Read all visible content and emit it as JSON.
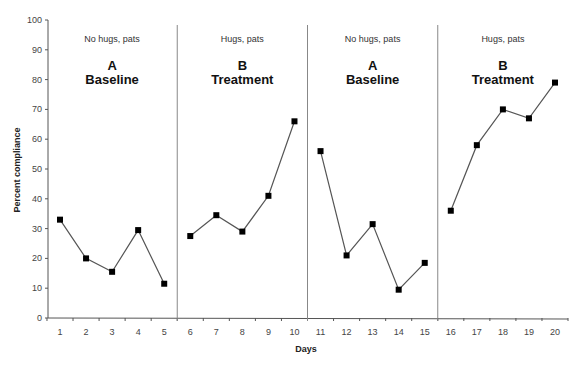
{
  "chart_data": {
    "type": "line",
    "title": "",
    "xlabel": "Days",
    "ylabel": "Percent compliance",
    "ylim": [
      0,
      100
    ],
    "yticks": [
      0,
      10,
      20,
      30,
      40,
      50,
      60,
      70,
      80,
      90,
      100
    ],
    "x": [
      1,
      2,
      3,
      4,
      5,
      6,
      7,
      8,
      9,
      10,
      11,
      12,
      13,
      14,
      15,
      16,
      17,
      18,
      19,
      20
    ],
    "grid": false,
    "legend": null,
    "phases": [
      {
        "letter": "A",
        "name": "Baseline",
        "condition": "No hugs, pats",
        "days": [
          1,
          2,
          3,
          4,
          5
        ],
        "values": [
          33,
          20,
          15.5,
          29.5,
          11.5
        ]
      },
      {
        "letter": "B",
        "name": "Treatment",
        "condition": "Hugs, pats",
        "days": [
          6,
          7,
          8,
          9,
          10
        ],
        "values": [
          27.5,
          34.5,
          29,
          41,
          66
        ]
      },
      {
        "letter": "A",
        "name": "Baseline",
        "condition": "No hugs, pats",
        "days": [
          11,
          12,
          13,
          14,
          15
        ],
        "values": [
          56,
          21,
          31.5,
          9.5,
          18.5
        ]
      },
      {
        "letter": "B",
        "name": "Treatment",
        "condition": "Hugs, pats",
        "days": [
          16,
          17,
          18,
          19,
          20
        ],
        "values": [
          36,
          58,
          70,
          67,
          79
        ]
      }
    ],
    "phase_change_lines_after_day": [
      5,
      10,
      15
    ],
    "marker": "square",
    "line_color": "#555555",
    "marker_color": "#000000"
  },
  "colors": {
    "axis": "#555555",
    "phase_line": "#888888",
    "line": "#555555",
    "marker": "#000000"
  }
}
